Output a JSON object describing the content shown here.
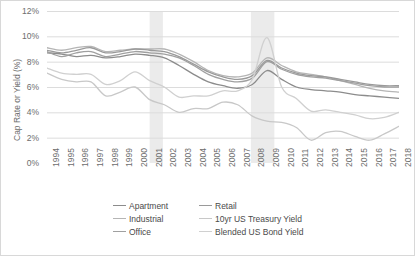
{
  "chart_data": {
    "type": "line",
    "title": "",
    "xlabel": "",
    "ylabel": "Cap Rate or Yield (%)",
    "ylim": [
      0,
      12
    ],
    "ytick_labels": [
      "0%",
      "2%",
      "4%",
      "6%",
      "8%",
      "10%",
      "12%"
    ],
    "ytick_values": [
      0,
      2,
      4,
      6,
      8,
      10,
      12
    ],
    "grid": true,
    "legend_position": "bottom",
    "x": [
      1994,
      1995,
      1996,
      1997,
      1998,
      1999,
      2000,
      2001,
      2002,
      2003,
      2004,
      2005,
      2006,
      2007,
      2008,
      2009,
      2010,
      2011,
      2012,
      2013,
      2014,
      2015,
      2016,
      2017,
      2018
    ],
    "xtick_labels": [
      "1994",
      "1995",
      "1996",
      "1997",
      "1998",
      "1999",
      "2000",
      "2001",
      "2002",
      "2003",
      "2004",
      "2005",
      "2006",
      "2007",
      "2008",
      "2009",
      "2010",
      "2011",
      "2012",
      "2013",
      "2014",
      "2015",
      "2016",
      "2017",
      "2018"
    ],
    "shaded_regions": [
      {
        "label": "recession",
        "x0": 2001.0,
        "x1": 2001.9,
        "color": "#ebebeb"
      },
      {
        "label": "recession",
        "x0": 2007.9,
        "x1": 2009.5,
        "color": "#ebebeb"
      }
    ],
    "series": [
      {
        "name": "Apartment",
        "color": "#8c8c8c",
        "values": [
          8.7,
          8.6,
          8.4,
          8.5,
          8.3,
          8.4,
          8.6,
          8.5,
          8.3,
          7.7,
          7.0,
          6.4,
          6.1,
          5.9,
          6.2,
          7.3,
          6.6,
          6.0,
          5.8,
          5.7,
          5.6,
          5.4,
          5.3,
          5.2,
          5.1
        ]
      },
      {
        "name": "Industrial",
        "color": "#b5b5b5",
        "values": [
          9.1,
          8.9,
          9.1,
          9.2,
          8.8,
          8.9,
          9.0,
          9.0,
          9.0,
          8.6,
          8.0,
          7.3,
          6.9,
          6.8,
          7.1,
          8.3,
          7.7,
          7.2,
          7.0,
          6.8,
          6.5,
          6.2,
          5.9,
          5.7,
          5.6
        ]
      },
      {
        "name": "Office",
        "color": "#a0a0a0",
        "values": [
          8.8,
          8.4,
          8.7,
          8.8,
          8.4,
          8.6,
          8.8,
          8.7,
          8.6,
          8.3,
          7.7,
          7.0,
          6.6,
          6.4,
          6.7,
          8.0,
          7.4,
          7.0,
          6.8,
          6.7,
          6.5,
          6.3,
          6.1,
          6.0,
          6.0
        ]
      },
      {
        "name": "Retail",
        "color": "#9a9a9a",
        "values": [
          8.9,
          8.7,
          8.9,
          9.1,
          8.7,
          8.8,
          9.0,
          8.9,
          8.8,
          8.4,
          7.8,
          7.2,
          6.8,
          6.6,
          6.9,
          8.1,
          7.5,
          7.1,
          6.9,
          6.8,
          6.6,
          6.4,
          6.2,
          6.1,
          6.1
        ]
      },
      {
        "name": "10yr US Treasury Yield",
        "color": "#c8c8c8",
        "values": [
          7.1,
          6.6,
          6.4,
          6.4,
          5.3,
          5.6,
          6.0,
          5.0,
          4.6,
          4.0,
          4.3,
          4.3,
          4.8,
          4.6,
          3.7,
          3.3,
          3.2,
          2.8,
          1.8,
          2.4,
          2.5,
          2.1,
          1.8,
          2.3,
          2.9
        ]
      },
      {
        "name": "Blended US Bond Yield",
        "color": "#d0d0d0",
        "values": [
          7.5,
          7.1,
          7.0,
          7.0,
          6.2,
          6.5,
          7.2,
          6.5,
          6.0,
          5.2,
          5.3,
          5.3,
          5.7,
          5.7,
          6.6,
          9.9,
          6.0,
          5.1,
          4.1,
          4.2,
          4.0,
          3.8,
          3.5,
          3.6,
          4.0
        ]
      }
    ]
  },
  "legend": {
    "items": [
      {
        "label": "Apartment",
        "color": "#8c8c8c",
        "column": 1
      },
      {
        "label": "Retail",
        "color": "#9a9a9a",
        "column": 2
      },
      {
        "label": "Industrial",
        "color": "#b5b5b5",
        "column": 1
      },
      {
        "label": "10yr US Treasury Yield",
        "color": "#c8c8c8",
        "column": 2
      },
      {
        "label": "Office",
        "color": "#a0a0a0",
        "column": 1
      },
      {
        "label": "Blended US Bond Yield",
        "color": "#d0d0d0",
        "column": 2
      }
    ]
  },
  "colors": {
    "grid": "#dcdcdc",
    "axis_text": "#6d6d6d",
    "legend_text": "#4a4a4a",
    "border": "#d8d8d8",
    "shade": "#ebebeb",
    "background": "#ffffff"
  }
}
